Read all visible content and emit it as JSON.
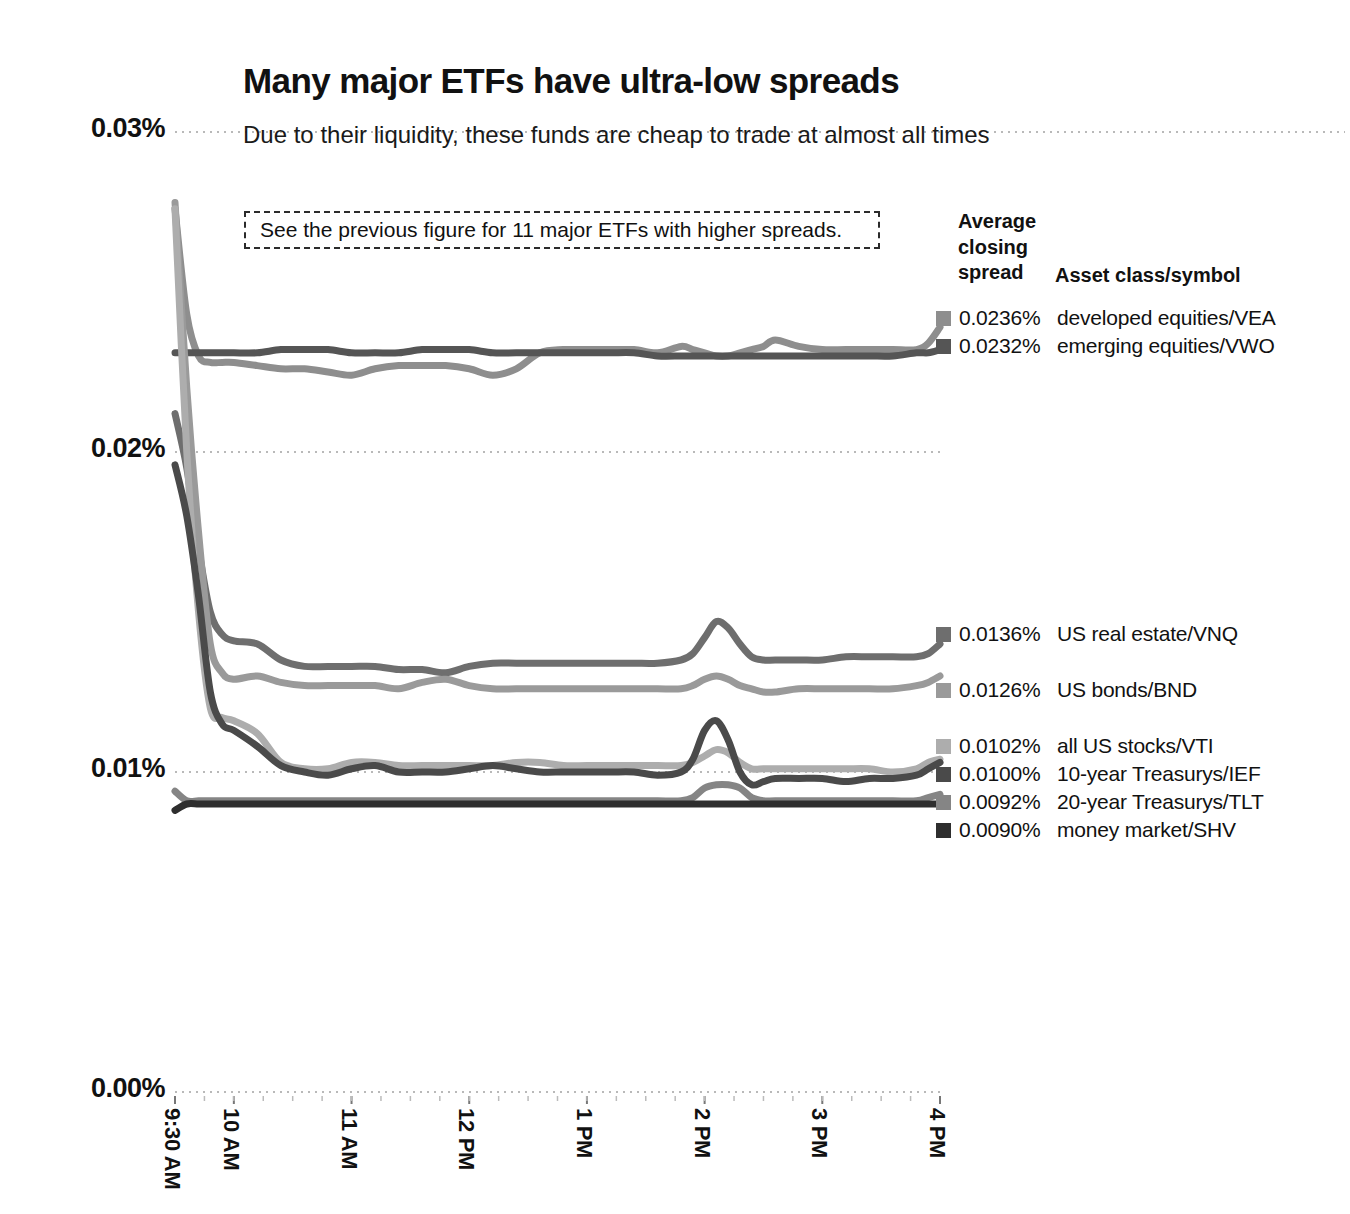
{
  "header": {
    "title": "Many major ETFs have ultra-low spreads",
    "subtitle": "Due to their liquidity, these funds are cheap to trade at almost all times"
  },
  "annotation": {
    "text": "See the previous figure for 11 major ETFs with higher spreads."
  },
  "legend": {
    "header_left": "Average\nclosing\nspread",
    "header_left_line1": "Average",
    "header_left_line2": "closing",
    "header_left_line3": "spread",
    "header_right": "Asset class/symbol",
    "rows": [
      {
        "value": "0.0236%",
        "name": "developed equities/VEA",
        "color": "#8e8e8e",
        "y": 318
      },
      {
        "value": "0.0232%",
        "name": "emerging equities/VWO",
        "color": "#555555",
        "y": 346
      },
      {
        "value": "0.0136%",
        "name": "US real estate/VNQ",
        "color": "#6e6e6e",
        "y": 634
      },
      {
        "value": "0.0126%",
        "name": "US bonds/BND",
        "color": "#9a9a9a",
        "y": 690
      },
      {
        "value": "0.0102%",
        "name": "all US stocks/VTI",
        "color": "#adadad",
        "y": 746
      },
      {
        "value": "0.0100%",
        "name": "10-year Treasurys/IEF",
        "color": "#4a4a4a",
        "y": 774
      },
      {
        "value": "0.0092%",
        "name": "20-year Treasurys/TLT",
        "color": "#858585",
        "y": 802
      },
      {
        "value": "0.0090%",
        "name": "money market/SHV",
        "color": "#2e2e2e",
        "y": 830
      }
    ]
  },
  "chart_data": {
    "type": "line",
    "title": "Many major ETFs have ultra-low spreads",
    "subtitle": "Due to their liquidity, these funds are cheap to trade at almost all times",
    "xlabel": "",
    "ylabel": "",
    "ylim": [
      0.0,
      0.03
    ],
    "yticks": [
      "0.00%",
      "0.01%",
      "0.02%",
      "0.03%"
    ],
    "ytick_values": [
      0.0,
      0.01,
      0.02,
      0.03
    ],
    "xticks": [
      "9:30 AM",
      "10 AM",
      "11 AM",
      "12 PM",
      "1 PM",
      "2 PM",
      "3 PM",
      "4 PM"
    ],
    "xtick_hours": [
      9.5,
      10,
      11,
      12,
      13,
      14,
      15,
      16
    ],
    "grid": "horizontal-dotted",
    "legend_position": "right",
    "x": [
      9.5,
      9.6,
      9.7,
      9.8,
      9.9,
      10.0,
      10.2,
      10.4,
      10.6,
      10.8,
      11.0,
      11.2,
      11.4,
      11.6,
      11.8,
      12.0,
      12.2,
      12.4,
      12.6,
      12.8,
      13.0,
      13.2,
      13.4,
      13.6,
      13.8,
      13.9,
      14.0,
      14.1,
      14.2,
      14.3,
      14.4,
      14.5,
      14.6,
      14.8,
      15.0,
      15.2,
      15.4,
      15.6,
      15.8,
      15.9,
      16.0
    ],
    "series": [
      {
        "name": "developed equities/VEA",
        "symbol": "VEA",
        "average_closing_spread": 0.0236,
        "color": "#8e8e8e",
        "values": [
          0.0276,
          0.0243,
          0.023,
          0.0228,
          0.0228,
          0.0228,
          0.0227,
          0.0226,
          0.0226,
          0.0225,
          0.0224,
          0.0226,
          0.0227,
          0.0227,
          0.0227,
          0.0226,
          0.0224,
          0.0226,
          0.0231,
          0.0232,
          0.0232,
          0.0232,
          0.0232,
          0.0231,
          0.0233,
          0.0232,
          0.0231,
          0.023,
          0.023,
          0.0231,
          0.0232,
          0.0233,
          0.0235,
          0.0233,
          0.0232,
          0.0232,
          0.0232,
          0.0232,
          0.0232,
          0.0234,
          0.0239
        ]
      },
      {
        "name": "emerging equities/VWO",
        "symbol": "VWO",
        "average_closing_spread": 0.0232,
        "color": "#555555",
        "values": [
          0.0231,
          0.0231,
          0.0231,
          0.0231,
          0.0231,
          0.0231,
          0.0231,
          0.0232,
          0.0232,
          0.0232,
          0.0231,
          0.0231,
          0.0231,
          0.0232,
          0.0232,
          0.0232,
          0.0231,
          0.0231,
          0.0231,
          0.0231,
          0.0231,
          0.0231,
          0.0231,
          0.023,
          0.023,
          0.023,
          0.023,
          0.023,
          0.023,
          0.023,
          0.023,
          0.023,
          0.023,
          0.023,
          0.023,
          0.023,
          0.023,
          0.023,
          0.0231,
          0.0231,
          0.0232
        ]
      },
      {
        "name": "US real estate/VNQ",
        "symbol": "VNQ",
        "average_closing_spread": 0.0136,
        "color": "#6e6e6e",
        "values": [
          0.0212,
          0.0195,
          0.017,
          0.015,
          0.0143,
          0.0141,
          0.014,
          0.0135,
          0.0133,
          0.0133,
          0.0133,
          0.0133,
          0.0132,
          0.0132,
          0.0131,
          0.0133,
          0.0134,
          0.0134,
          0.0134,
          0.0134,
          0.0134,
          0.0134,
          0.0134,
          0.0134,
          0.0135,
          0.0137,
          0.0142,
          0.0147,
          0.0145,
          0.014,
          0.0136,
          0.0135,
          0.0135,
          0.0135,
          0.0135,
          0.0136,
          0.0136,
          0.0136,
          0.0136,
          0.0137,
          0.014
        ]
      },
      {
        "name": "US bonds/BND",
        "symbol": "BND",
        "average_closing_spread": 0.0126,
        "color": "#9a9a9a",
        "values": [
          0.0278,
          0.022,
          0.0175,
          0.014,
          0.0131,
          0.0129,
          0.013,
          0.0128,
          0.0127,
          0.0127,
          0.0127,
          0.0127,
          0.0126,
          0.0128,
          0.0129,
          0.0127,
          0.0126,
          0.0126,
          0.0126,
          0.0126,
          0.0126,
          0.0126,
          0.0126,
          0.0126,
          0.0126,
          0.0127,
          0.0129,
          0.013,
          0.0129,
          0.0127,
          0.0126,
          0.0125,
          0.0125,
          0.0126,
          0.0126,
          0.0126,
          0.0126,
          0.0126,
          0.0127,
          0.0128,
          0.013
        ]
      },
      {
        "name": "all US stocks/VTI",
        "symbol": "VTI",
        "average_closing_spread": 0.0102,
        "color": "#adadad",
        "values": [
          0.0276,
          0.02,
          0.015,
          0.012,
          0.0117,
          0.0116,
          0.0112,
          0.0103,
          0.0101,
          0.0101,
          0.0103,
          0.0103,
          0.0102,
          0.0102,
          0.0102,
          0.0102,
          0.0102,
          0.0103,
          0.0103,
          0.0102,
          0.0102,
          0.0102,
          0.0102,
          0.0102,
          0.0102,
          0.0103,
          0.0105,
          0.0107,
          0.0106,
          0.0103,
          0.0101,
          0.0101,
          0.0101,
          0.0101,
          0.0101,
          0.0101,
          0.0101,
          0.01,
          0.0101,
          0.0103,
          0.0104
        ]
      },
      {
        "name": "10-year Treasurys/IEF",
        "symbol": "IEF",
        "average_closing_spread": 0.01,
        "color": "#4a4a4a",
        "values": [
          0.0196,
          0.018,
          0.0155,
          0.0125,
          0.0115,
          0.0113,
          0.0108,
          0.0102,
          0.01,
          0.0099,
          0.0101,
          0.0102,
          0.01,
          0.01,
          0.01,
          0.0101,
          0.0102,
          0.0101,
          0.01,
          0.01,
          0.01,
          0.01,
          0.01,
          0.0099,
          0.01,
          0.0104,
          0.0113,
          0.0116,
          0.011,
          0.01,
          0.0096,
          0.0097,
          0.0098,
          0.0098,
          0.0098,
          0.0097,
          0.0098,
          0.0098,
          0.0099,
          0.0101,
          0.0103
        ]
      },
      {
        "name": "20-year Treasurys/TLT",
        "symbol": "TLT",
        "average_closing_spread": 0.0092,
        "color": "#858585",
        "values": [
          0.0094,
          0.0091,
          0.0091,
          0.0091,
          0.0091,
          0.0091,
          0.0091,
          0.0091,
          0.0091,
          0.0091,
          0.0091,
          0.0091,
          0.0091,
          0.0091,
          0.0091,
          0.0091,
          0.0091,
          0.0091,
          0.0091,
          0.0091,
          0.0091,
          0.0091,
          0.0091,
          0.0091,
          0.0091,
          0.0092,
          0.0095,
          0.0096,
          0.0096,
          0.0095,
          0.0092,
          0.0091,
          0.0091,
          0.0091,
          0.0091,
          0.0091,
          0.0091,
          0.0091,
          0.0091,
          0.0092,
          0.0093
        ]
      },
      {
        "name": "money market/SHV",
        "symbol": "SHV",
        "average_closing_spread": 0.009,
        "color": "#2e2e2e",
        "values": [
          0.0088,
          0.009,
          0.009,
          0.009,
          0.009,
          0.009,
          0.009,
          0.009,
          0.009,
          0.009,
          0.009,
          0.009,
          0.009,
          0.009,
          0.009,
          0.009,
          0.009,
          0.009,
          0.009,
          0.009,
          0.009,
          0.009,
          0.009,
          0.009,
          0.009,
          0.009,
          0.009,
          0.009,
          0.009,
          0.009,
          0.009,
          0.009,
          0.009,
          0.009,
          0.009,
          0.009,
          0.009,
          0.009,
          0.009,
          0.009,
          0.009
        ]
      }
    ]
  }
}
